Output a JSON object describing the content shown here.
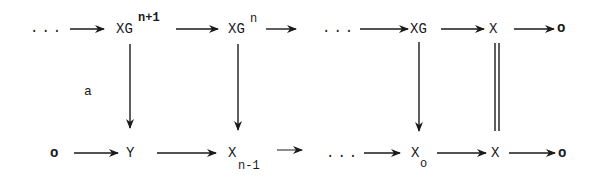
{
  "diagram": {
    "type": "commutative-diagram",
    "top_row": {
      "dots_left": "...",
      "xg_n1": {
        "base": "XG",
        "sup": "n+1"
      },
      "xg_n": {
        "base": "XG",
        "sup": "n"
      },
      "dots_mid": "...",
      "xg": "XG",
      "x": "X",
      "zero": "o"
    },
    "bottom_row": {
      "zero_left": "o",
      "y": "Y",
      "x_n1": {
        "base": "X",
        "sub": "n-1"
      },
      "dots_mid": "...",
      "x_o": {
        "base": "X",
        "sub": "o"
      },
      "x": "X",
      "zero": "o"
    },
    "vertical_labels": {
      "a": "a"
    },
    "edges": [
      {
        "from": "...",
        "to": "XG^n+1",
        "type": "arrow"
      },
      {
        "from": "XG^n+1",
        "to": "XG^n",
        "type": "arrow"
      },
      {
        "from": "XG^n",
        "to": "...",
        "type": "arrow"
      },
      {
        "from": "...",
        "to": "XG",
        "type": "arrow"
      },
      {
        "from": "XG",
        "to": "X",
        "type": "arrow"
      },
      {
        "from": "X",
        "to": "o",
        "type": "arrow"
      },
      {
        "from": "o",
        "to": "Y",
        "type": "arrow"
      },
      {
        "from": "Y",
        "to": "X_n-1",
        "type": "arrow"
      },
      {
        "from": "X_n-1",
        "to": "...",
        "type": "arrow"
      },
      {
        "from": "...",
        "to": "X_o",
        "type": "arrow"
      },
      {
        "from": "X_o",
        "to": "X",
        "type": "arrow"
      },
      {
        "from": "X",
        "to": "o",
        "type": "arrow"
      },
      {
        "from": "XG^n+1",
        "to": "Y",
        "type": "arrow",
        "label": "a"
      },
      {
        "from": "XG^n",
        "to": "X_n-1",
        "type": "arrow"
      },
      {
        "from": "XG",
        "to": "X_o",
        "type": "arrow"
      },
      {
        "from": "X",
        "to": "X",
        "type": "equality"
      }
    ]
  }
}
